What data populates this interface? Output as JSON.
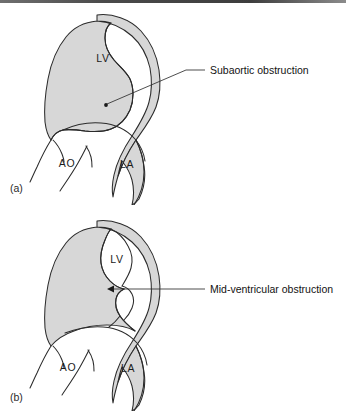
{
  "figure": {
    "background_color": "#ffffff",
    "myocardium_fill": "#d7d7d7",
    "outline_color": "#2b2b2b",
    "cavity_fill": "#ffffff",
    "leader_color": "#2e2e2e"
  },
  "panels": [
    {
      "tag": "(a)",
      "tag_name": "panel-tag-a",
      "labels": {
        "lv": "LV",
        "ao": "AO",
        "la": "LA"
      },
      "callout": {
        "text": "Subaortic obstruction",
        "marker": "dot"
      }
    },
    {
      "tag": "(b)",
      "tag_name": "panel-tag-b",
      "labels": {
        "lv": "LV",
        "ao": "AO",
        "la": "LA"
      },
      "callout": {
        "text": "Mid-ventricular obstruction",
        "marker": "arrowhead"
      }
    }
  ]
}
